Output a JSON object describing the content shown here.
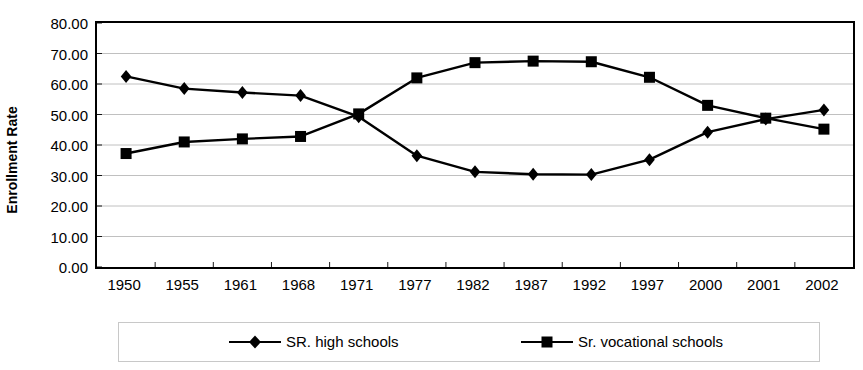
{
  "chart_data": {
    "type": "line",
    "title": "",
    "subtitle": "",
    "xlabel": "",
    "ylabel": "Enrollment Rate",
    "categories": [
      "1950",
      "1955",
      "1961",
      "1968",
      "1971",
      "1977",
      "1982",
      "1987",
      "1992",
      "1997",
      "2000",
      "2001",
      "2002"
    ],
    "ylim": [
      0,
      80
    ],
    "ytick_values": [
      0,
      10,
      20,
      30,
      40,
      50,
      60,
      70,
      80
    ],
    "ytick_labels": [
      "0.00",
      "10.00",
      "20.00",
      "30.00",
      "40.00",
      "50.00",
      "60.00",
      "70.00",
      "80.00"
    ],
    "grid": "horizontal",
    "legend_position": "bottom",
    "series": [
      {
        "name": "SR. high schools",
        "marker": "diamond",
        "color": "#000000",
        "values": [
          62.5,
          58.5,
          57.2,
          56.2,
          49.3,
          36.5,
          31.2,
          30.4,
          30.3,
          35.2,
          44.2,
          48.5,
          51.5
        ]
      },
      {
        "name": "Sr. vocational schools",
        "marker": "square",
        "color": "#000000",
        "values": [
          37.2,
          41.0,
          42.0,
          42.8,
          50.2,
          62.0,
          67.0,
          67.5,
          67.3,
          62.2,
          53.0,
          48.8,
          45.2
        ]
      }
    ]
  },
  "legend": {
    "entries": [
      {
        "label": "SR. high schools",
        "marker": "diamond"
      },
      {
        "label": "Sr. vocational schools",
        "marker": "square"
      }
    ]
  },
  "axis": {
    "y_title": "Enrollment Rate"
  },
  "colors": {
    "line": "#000000",
    "grid": "#b0b0b0",
    "frame": "#000000",
    "legend_border": "#c8c8c8",
    "background": "#ffffff"
  }
}
